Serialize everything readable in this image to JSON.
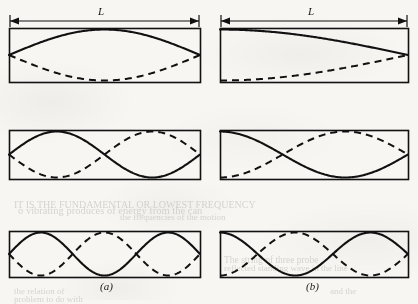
{
  "figure": {
    "kind": "standing-wave-modes-diagram",
    "background_color": "#f7f6f3",
    "ink_color": "#111111",
    "dimension_label": "L",
    "columns": [
      {
        "id": "a",
        "caption": "(a)",
        "caption_x": 100,
        "caption_y": 280
      },
      {
        "id": "b",
        "caption": "(b)",
        "caption_x": 306,
        "caption_y": 280
      }
    ],
    "dimension_arrows": [
      {
        "label": "L",
        "label_x": 98,
        "label_y": 5,
        "x1": 10,
        "x2": 199,
        "y": 21
      },
      {
        "label": "L",
        "label_x": 308,
        "label_y": 5,
        "x1": 221,
        "x2": 407,
        "y": 21
      }
    ],
    "panels": [
      {
        "name": "panel-a-mode-1",
        "column": "a",
        "row": 1,
        "x": 9,
        "y": 28,
        "w": 191,
        "h": 54,
        "mode": 1,
        "boundary": "fixed-fixed",
        "harmonic_label": "first harmonic",
        "solid_phase": "sine",
        "dashed_phase": "inverted-sine"
      },
      {
        "name": "panel-b-mode-1",
        "column": "b",
        "row": 1,
        "x": 220,
        "y": 28,
        "w": 188,
        "h": 54,
        "mode": 1,
        "boundary": "fixed-free",
        "harmonic_label": "first harmonic",
        "solid_phase": "cosine-quarter",
        "dashed_phase": "inverted-cosine-quarter"
      },
      {
        "name": "panel-a-mode-2",
        "column": "a",
        "row": 2,
        "x": 9,
        "y": 130,
        "w": 191,
        "h": 49,
        "mode": 2,
        "boundary": "fixed-fixed",
        "harmonic_label": "second harmonic",
        "solid_phase": "sine",
        "dashed_phase": "inverted-sine"
      },
      {
        "name": "panel-b-mode-2",
        "column": "b",
        "row": 2,
        "x": 220,
        "y": 130,
        "w": 188,
        "h": 49,
        "mode": 2,
        "boundary": "fixed-free",
        "harmonic_label": "third harmonic",
        "solid_phase": "cosine-quarter",
        "dashed_phase": "inverted-cosine-quarter"
      },
      {
        "name": "panel-a-mode-3",
        "column": "a",
        "row": 3,
        "x": 9,
        "y": 231,
        "w": 191,
        "h": 46,
        "mode": 3,
        "boundary": "fixed-fixed",
        "harmonic_label": "third harmonic",
        "solid_phase": "sine",
        "dashed_phase": "inverted-sine"
      },
      {
        "name": "panel-b-mode-3",
        "column": "b",
        "row": 3,
        "x": 220,
        "y": 231,
        "w": 188,
        "h": 46,
        "mode": 3,
        "boundary": "fixed-free",
        "harmonic_label": "fifth harmonic",
        "solid_phase": "cosine-quarter",
        "dashed_phase": "inverted-cosine-quarter"
      }
    ],
    "ghost_text": [
      {
        "text": "IT IS THE FUNDAMENTAL OR LOWEST FREQUENCY",
        "x": 14,
        "y": 199,
        "size": 10
      },
      {
        "text": "o  vibrating  produces  of  energy  from  the  can",
        "x": 18,
        "y": 205,
        "size": 10.5
      },
      {
        "text": "the  frequencies  of  the  motion",
        "x": 120,
        "y": 212,
        "size": 9
      },
      {
        "text": "The  string  of  three  probe",
        "x": 224,
        "y": 255,
        "size": 9.5
      },
      {
        "text": "reflected  standing  wave  in  the  line",
        "x": 224,
        "y": 263,
        "size": 9
      },
      {
        "text": "the  relation  of",
        "x": 14,
        "y": 286,
        "size": 9
      },
      {
        "text": "problem  to  do  with",
        "x": 14,
        "y": 294,
        "size": 9
      },
      {
        "text": "and  the",
        "x": 330,
        "y": 286,
        "size": 9
      }
    ]
  }
}
